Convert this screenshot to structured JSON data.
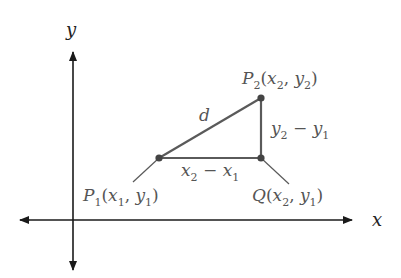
{
  "diagram": {
    "axes": {
      "x_label": "x",
      "y_label": "y"
    },
    "points": {
      "p1": {
        "name": "P",
        "sub": "1",
        "x_sub": "1",
        "y_sub": "1",
        "x": "x",
        "y": "y"
      },
      "p2": {
        "name": "P",
        "sub": "2",
        "x_sub": "2",
        "y_sub": "2",
        "x": "x",
        "y": "y"
      },
      "q": {
        "name": "Q",
        "x_sub": "2",
        "y_sub": "1",
        "x": "x",
        "y": "y"
      }
    },
    "segments": {
      "hypotenuse_label": "d",
      "horizontal": {
        "a": "x",
        "a_sub": "2",
        "op": "−",
        "b": "x",
        "b_sub": "1"
      },
      "vertical": {
        "a": "y",
        "a_sub": "2",
        "op": "−",
        "b": "y",
        "b_sub": "1"
      }
    },
    "colors": {
      "axes": "#1a1a1a",
      "triangle": "#5a5a5a",
      "labels": "#555555"
    }
  }
}
